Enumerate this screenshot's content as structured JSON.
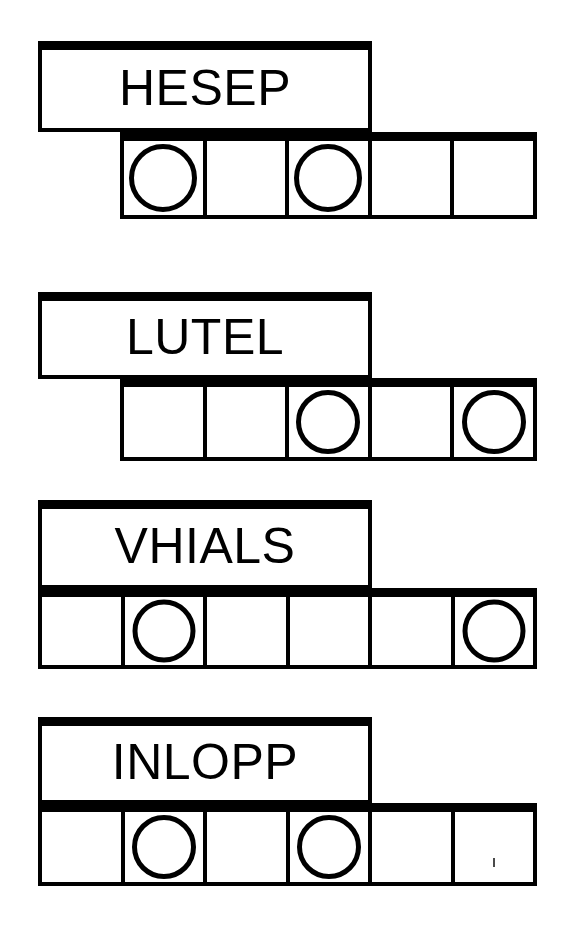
{
  "page": {
    "background_color": "#ffffff",
    "ink_color": "#000000",
    "width": 586,
    "height": 925
  },
  "groups": [
    {
      "id": "group-1",
      "word": "HESEP",
      "label_box": {
        "x": 38,
        "y": 41,
        "width": 334,
        "height": 91
      },
      "grid_row": {
        "x": 120,
        "y": 132,
        "width": 417,
        "height": 87
      },
      "cell_count": 5,
      "circle_cells": [
        1,
        3
      ],
      "cells": [
        {
          "index": 1,
          "circle": true,
          "speck": false
        },
        {
          "index": 2,
          "circle": false,
          "speck": false
        },
        {
          "index": 3,
          "circle": true,
          "speck": false
        },
        {
          "index": 4,
          "circle": false,
          "speck": false
        },
        {
          "index": 5,
          "circle": false,
          "speck": false
        }
      ]
    },
    {
      "id": "group-2",
      "word": "LUTEL",
      "label_box": {
        "x": 38,
        "y": 292,
        "width": 334,
        "height": 87
      },
      "grid_row": {
        "x": 120,
        "y": 378,
        "width": 417,
        "height": 83
      },
      "cell_count": 5,
      "circle_cells": [
        3,
        5
      ],
      "cells": [
        {
          "index": 1,
          "circle": false,
          "speck": false
        },
        {
          "index": 2,
          "circle": false,
          "speck": false
        },
        {
          "index": 3,
          "circle": true,
          "speck": false
        },
        {
          "index": 4,
          "circle": false,
          "speck": false
        },
        {
          "index": 5,
          "circle": true,
          "speck": false
        }
      ]
    },
    {
      "id": "group-3",
      "word": "VHIALS",
      "label_box": {
        "x": 38,
        "y": 500,
        "width": 334,
        "height": 89
      },
      "grid_row": {
        "x": 38,
        "y": 588,
        "width": 499,
        "height": 81
      },
      "cell_count": 6,
      "circle_cells": [
        2,
        6
      ],
      "cells": [
        {
          "index": 1,
          "circle": false,
          "speck": false
        },
        {
          "index": 2,
          "circle": true,
          "speck": false
        },
        {
          "index": 3,
          "circle": false,
          "speck": false
        },
        {
          "index": 4,
          "circle": false,
          "speck": false
        },
        {
          "index": 5,
          "circle": false,
          "speck": false
        },
        {
          "index": 6,
          "circle": true,
          "speck": false
        }
      ]
    },
    {
      "id": "group-4",
      "word": "INLOPP",
      "label_box": {
        "x": 38,
        "y": 717,
        "width": 334,
        "height": 87
      },
      "grid_row": {
        "x": 38,
        "y": 803,
        "width": 499,
        "height": 83
      },
      "cell_count": 6,
      "circle_cells": [
        2,
        4
      ],
      "cells": [
        {
          "index": 1,
          "circle": false,
          "speck": false
        },
        {
          "index": 2,
          "circle": true,
          "speck": false
        },
        {
          "index": 3,
          "circle": false,
          "speck": false
        },
        {
          "index": 4,
          "circle": true,
          "speck": false
        },
        {
          "index": 5,
          "circle": false,
          "speck": false
        },
        {
          "index": 6,
          "circle": false,
          "speck": true
        }
      ]
    }
  ]
}
